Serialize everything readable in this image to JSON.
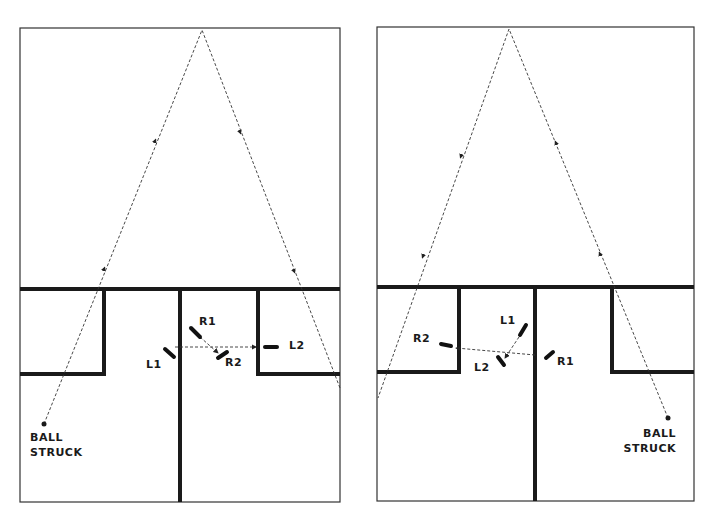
{
  "diagrams": [
    {
      "id": "left",
      "frame": {
        "x1": 20,
        "y1": 28,
        "x2": 340,
        "y2": 502
      },
      "midline_y": 289,
      "left_box": {
        "x1": 20,
        "y1": 289,
        "x2": 104,
        "y2": 374
      },
      "right_box": {
        "x1": 258,
        "y1": 289,
        "x2": 340,
        "y2": 374
      },
      "center_divider_x": 180,
      "ball_path": [
        [
          44,
          424
        ],
        [
          202,
          30
        ],
        [
          340,
          388
        ]
      ],
      "arrows": [
        {
          "x": 155,
          "y": 141,
          "dir": "up"
        },
        {
          "x": 240,
          "y": 132,
          "dir": "down"
        },
        {
          "x": 104,
          "y": 269,
          "dir": "up"
        },
        {
          "x": 294,
          "y": 271,
          "dir": "down"
        }
      ],
      "players": [
        {
          "label": "R1",
          "x1": 191,
          "y1": 328,
          "x2": 200,
          "y2": 337,
          "lx": 199,
          "ly": 316
        },
        {
          "label": "R2",
          "x1": 218,
          "y1": 358,
          "x2": 227,
          "y2": 352,
          "lx": 225,
          "ly": 357
        },
        {
          "label": "L1",
          "x1": 165,
          "y1": 349,
          "x2": 174,
          "y2": 357,
          "lx": 146,
          "ly": 359
        },
        {
          "label": "L2",
          "x1": 265,
          "y1": 347,
          "x2": 277,
          "y2": 347,
          "lx": 289,
          "ly": 340
        }
      ],
      "pass_lines": [
        [
          [
            175,
            347
          ],
          [
            256,
            347
          ]
        ],
        [
          [
            200,
            337
          ],
          [
            218,
            353
          ]
        ]
      ],
      "ball_label": [
        "BALL",
        "STRUCK"
      ],
      "ball_label_pos": {
        "x": 30,
        "y": 432
      },
      "ball_label_align": "left"
    },
    {
      "id": "right",
      "frame": {
        "x1": 377,
        "y1": 27,
        "x2": 694,
        "y2": 501
      },
      "midline_y": 287,
      "left_box": {
        "x1": 377,
        "y1": 287,
        "x2": 459,
        "y2": 372
      },
      "right_box": {
        "x1": 612,
        "y1": 287,
        "x2": 694,
        "y2": 372
      },
      "center_divider_x": 535,
      "ball_path": [
        [
          668,
          418
        ],
        [
          509,
          29
        ],
        [
          378,
          398
        ]
      ],
      "arrows": [
        {
          "x": 461,
          "y": 156,
          "dir": "down"
        },
        {
          "x": 556,
          "y": 143,
          "dir": "up"
        },
        {
          "x": 423,
          "y": 256,
          "dir": "down"
        },
        {
          "x": 600,
          "y": 254,
          "dir": "up"
        }
      ],
      "players": [
        {
          "label": "L1",
          "x1": 526,
          "y1": 325,
          "x2": 520,
          "y2": 335,
          "lx": 500,
          "ly": 315
        },
        {
          "label": "L2",
          "x1": 498,
          "y1": 357,
          "x2": 504,
          "y2": 365,
          "lx": 474,
          "ly": 362
        },
        {
          "label": "R1",
          "x1": 546,
          "y1": 358,
          "x2": 553,
          "y2": 352,
          "lx": 557,
          "ly": 356
        },
        {
          "label": "R2",
          "x1": 441,
          "y1": 344,
          "x2": 451,
          "y2": 346,
          "lx": 413,
          "ly": 333
        }
      ],
      "pass_lines": [
        [
          [
            535,
            355
          ],
          [
            456,
            348
          ]
        ],
        [
          [
            519,
            337
          ],
          [
            505,
            358
          ]
        ]
      ],
      "ball_label": [
        "BALL",
        "STRUCK"
      ],
      "ball_label_pos": {
        "x": 676,
        "y": 428
      },
      "ball_label_align": "right"
    }
  ]
}
